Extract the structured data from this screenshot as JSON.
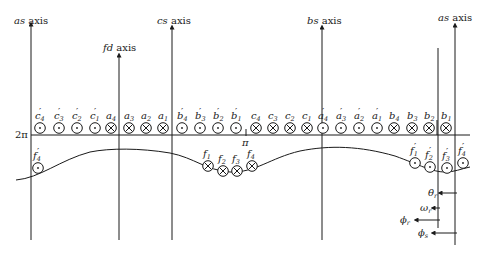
{
  "axes": [
    {
      "id": "as-left",
      "name": "as",
      "suffix": " axis",
      "x": 31,
      "top": 24,
      "label_x": 14,
      "label_y": 24
    },
    {
      "id": "fd",
      "name": "fd",
      "suffix": " axis",
      "x": 119,
      "top": 55,
      "label_x": 103,
      "label_y": 51
    },
    {
      "id": "cs",
      "name": "cs",
      "suffix": " axis",
      "x": 172,
      "top": 27,
      "label_x": 157,
      "label_y": 24
    },
    {
      "id": "bs",
      "name": "bs",
      "suffix": " axis",
      "x": 322,
      "top": 27,
      "label_x": 307,
      "label_y": 24
    },
    {
      "id": "as-right",
      "name": "as",
      "suffix": " axis",
      "x": 455,
      "top": 25,
      "label_x": 438,
      "label_y": 21
    }
  ],
  "stator": {
    "line_y": 135,
    "line_label": "2π",
    "mid_label": "π",
    "conductors": [
      {
        "base": "c",
        "sub": "4",
        "prime": true,
        "dir": "out",
        "x": 40
      },
      {
        "base": "c",
        "sub": "3",
        "prime": true,
        "dir": "out",
        "x": 59
      },
      {
        "base": "c",
        "sub": "2",
        "prime": true,
        "dir": "out",
        "x": 77
      },
      {
        "base": "c",
        "sub": "1",
        "prime": true,
        "dir": "out",
        "x": 95
      },
      {
        "base": "a",
        "sub": "4",
        "prime": false,
        "dir": "in",
        "x": 111
      },
      {
        "base": "a",
        "sub": "3",
        "prime": false,
        "dir": "in",
        "x": 129
      },
      {
        "base": "a",
        "sub": "2",
        "prime": false,
        "dir": "in",
        "x": 146
      },
      {
        "base": "a",
        "sub": "1",
        "prime": false,
        "dir": "in",
        "x": 163
      },
      {
        "base": "b",
        "sub": "4",
        "prime": true,
        "dir": "out",
        "x": 182
      },
      {
        "base": "b",
        "sub": "3",
        "prime": true,
        "dir": "out",
        "x": 200
      },
      {
        "base": "b",
        "sub": "2",
        "prime": true,
        "dir": "out",
        "x": 218
      },
      {
        "base": "b",
        "sub": "1",
        "prime": true,
        "dir": "out",
        "x": 236
      },
      {
        "base": "c",
        "sub": "4",
        "prime": false,
        "dir": "in",
        "x": 256
      },
      {
        "base": "c",
        "sub": "3",
        "prime": false,
        "dir": "in",
        "x": 273
      },
      {
        "base": "c",
        "sub": "2",
        "prime": false,
        "dir": "in",
        "x": 290
      },
      {
        "base": "c",
        "sub": "1",
        "prime": false,
        "dir": "in",
        "x": 307
      },
      {
        "base": "a",
        "sub": "4",
        "prime": true,
        "dir": "out",
        "x": 323
      },
      {
        "base": "a",
        "sub": "3",
        "prime": true,
        "dir": "out",
        "x": 341
      },
      {
        "base": "a",
        "sub": "2",
        "prime": true,
        "dir": "out",
        "x": 359
      },
      {
        "base": "a",
        "sub": "1",
        "prime": true,
        "dir": "out",
        "x": 377
      },
      {
        "base": "b",
        "sub": "4",
        "prime": false,
        "dir": "in",
        "x": 394
      },
      {
        "base": "b",
        "sub": "3",
        "prime": false,
        "dir": "in",
        "x": 412
      },
      {
        "base": "b",
        "sub": "2",
        "prime": false,
        "dir": "in",
        "x": 429
      },
      {
        "base": "b",
        "sub": "1",
        "prime": false,
        "dir": "in",
        "x": 446
      }
    ]
  },
  "rotor": {
    "conductors": [
      {
        "base": "f",
        "sub": "4",
        "prime": true,
        "dir": "out",
        "x": 38,
        "y": 168
      },
      {
        "base": "f",
        "sub": "1",
        "prime": false,
        "dir": "in",
        "x": 208,
        "y": 166
      },
      {
        "base": "f",
        "sub": "2",
        "prime": false,
        "dir": "in",
        "x": 223,
        "y": 171
      },
      {
        "base": "f",
        "sub": "3",
        "prime": false,
        "dir": "in",
        "x": 237,
        "y": 171
      },
      {
        "base": "f",
        "sub": "4",
        "prime": false,
        "dir": "in",
        "x": 252,
        "y": 166
      },
      {
        "base": "f",
        "sub": "1",
        "prime": true,
        "dir": "out",
        "x": 415,
        "y": 163
      },
      {
        "base": "f",
        "sub": "2",
        "prime": true,
        "dir": "out",
        "x": 430,
        "y": 167
      },
      {
        "base": "f",
        "sub": "3",
        "prime": true,
        "dir": "out",
        "x": 447,
        "y": 168
      },
      {
        "base": "f",
        "sub": "4",
        "prime": true,
        "dir": "out",
        "x": 463,
        "y": 163
      }
    ]
  },
  "angles": [
    {
      "sym": "θ",
      "sub": "r",
      "y": 193,
      "from_x": 457,
      "to_x": 440,
      "label_x": 428
    },
    {
      "sym": "ω",
      "sub": "r",
      "y": 208,
      "from_x": 440,
      "to_x": 433,
      "label_x": 420
    },
    {
      "sym": "ϕ",
      "sub": "r",
      "y": 220,
      "from_x": 440,
      "to_x": 416,
      "label_x": 400
    },
    {
      "sym": "ϕ",
      "sub": "s",
      "y": 233,
      "from_x": 457,
      "to_x": 433,
      "label_x": 418
    }
  ]
}
